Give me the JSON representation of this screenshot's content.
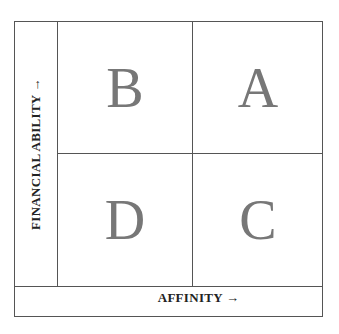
{
  "diagram": {
    "type": "2x2 matrix",
    "y_axis_label": "FINANCIAL ABILITY →",
    "x_axis_label": "AFFINITY →",
    "quadrants": {
      "top_left": "B",
      "top_right": "A",
      "bottom_left": "D",
      "bottom_right": "C"
    },
    "colors": {
      "border": "#555555",
      "quadrant_letter": "#777777",
      "label_text": "#222222"
    }
  }
}
